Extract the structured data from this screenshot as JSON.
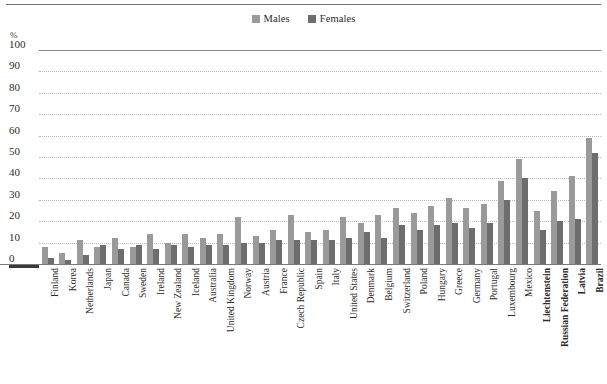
{
  "chart_data": {
    "type": "bar",
    "title": "",
    "subtitle": "",
    "xlabel": "",
    "ylabel": "%",
    "ylim": [
      0,
      100
    ],
    "yticks": [
      100,
      90,
      80,
      70,
      60,
      50,
      40,
      30,
      20,
      10,
      0
    ],
    "grid": true,
    "legend_position": "top-center",
    "colors": {
      "males": "#9a9a9a",
      "females": "#6d6d6d"
    },
    "categories": [
      "Finland",
      "Korea",
      "Netherlands",
      "Japan",
      "Canada",
      "Sweden",
      "Ireland",
      "New Zealand",
      "Iceland",
      "Australia",
      "United Kingdom",
      "Norway",
      "Austria",
      "France",
      "Czech Republic",
      "Spain",
      "Italy",
      "United States",
      "Denmark",
      "Belgium",
      "Switzerland",
      "Poland",
      "Hungary",
      "Greece",
      "Germany",
      "Portugal",
      "Luxembourg",
      "Mexico",
      "Liechtenstein",
      "Russian Federation",
      "Latvia",
      "Brazil"
    ],
    "bold_categories": [
      "Liechtenstein",
      "Russian Federation",
      "Latvia",
      "Brazil"
    ],
    "series": [
      {
        "name": "Males",
        "values": [
          8,
          5,
          11,
          8,
          12,
          8,
          14,
          10,
          14,
          12,
          14,
          22,
          13,
          16,
          23,
          15,
          16,
          22,
          19,
          23,
          26,
          24,
          27,
          31,
          26,
          28,
          39,
          49,
          25,
          34,
          41,
          59
        ]
      },
      {
        "name": "Females",
        "values": [
          3,
          2,
          4,
          9,
          7,
          9,
          7,
          9,
          8,
          9,
          9,
          10,
          10,
          11,
          11,
          11,
          11,
          12,
          15,
          12,
          18,
          16,
          18,
          19,
          17,
          19,
          30,
          40,
          16,
          20,
          21,
          52
        ]
      }
    ]
  },
  "legend": {
    "entries": [
      {
        "label": "Males",
        "color": "#9a9a9a"
      },
      {
        "label": "Females",
        "color": "#6d6d6d"
      }
    ]
  },
  "axis": {
    "unit_label": "%"
  }
}
